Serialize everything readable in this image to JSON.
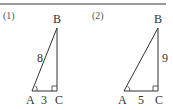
{
  "problems": [
    {
      "number": "(1)",
      "vertices": {
        "A": "A",
        "B": "B",
        "C": "C"
      },
      "hypotenuse_label": "8",
      "base_label": "3",
      "side_label": ""
    },
    {
      "number": "(2)",
      "vertices": {
        "A": "A",
        "B": "B",
        "C": "C"
      },
      "hypotenuse_label": "",
      "base_label": "5",
      "side_label": "9"
    }
  ],
  "colors": {
    "line": "#333333",
    "rule": "#777777"
  }
}
